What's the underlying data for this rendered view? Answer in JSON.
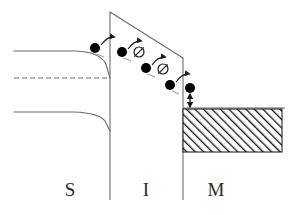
{
  "figure": {
    "kind": "semiconductor-band-diagram",
    "background_color": "#ffffff",
    "line_color": "#6b6b6b",
    "dark_line_color": "#333333",
    "carrier_color": "#000000",
    "label_color": "#2b2b2b",
    "hatch_color": "#111111"
  },
  "regions": [
    {
      "id": "semiconductor",
      "label": "S",
      "label_x": 70,
      "label_y": 196,
      "x_start": 14,
      "x_end": 110
    },
    {
      "id": "insulator",
      "label": "I",
      "label_x": 146,
      "label_y": 196,
      "x_start": 110,
      "x_end": 183
    },
    {
      "id": "metal",
      "label": "M",
      "label_x": 216,
      "label_y": 196,
      "x_start": 183,
      "x_end": 285
    }
  ],
  "interfaces": [
    {
      "id": "s-i-interface",
      "x": 110,
      "y_top": 12,
      "y_bottom": 200
    },
    {
      "id": "i-m-interface",
      "x": 183,
      "y_top": 58,
      "y_bottom": 200
    }
  ],
  "bands": {
    "semiconductor_conduction_band": {
      "name": "conduction-band-edge",
      "style": "solid",
      "path": "M 14 51 L 76 51 Q 100 52 106 64 L 110 78"
    },
    "semiconductor_fermi_level": {
      "name": "fermi-level",
      "style": "dashed",
      "dash": "5,3",
      "path": "M 14 78 L 110 78"
    },
    "semiconductor_valence_band": {
      "name": "valence-band-edge",
      "style": "solid",
      "path": "M 14 112 L 74 112 Q 99 113 105 121 L 110 131"
    },
    "insulator_conduction_band": {
      "name": "insulator-conduction-band",
      "style": "solid",
      "path": "M 110 12 L 183 58"
    },
    "metal_fermi_level": {
      "name": "metal-fermi-level",
      "style": "solid",
      "path": "M 183 108 L 285 108"
    }
  },
  "metal_fill": {
    "name": "metal-filled-states",
    "x": 183,
    "y": 109,
    "width": 99,
    "height": 43,
    "hatch": "diagonal-45"
  },
  "carriers": [
    {
      "id": "electron-1",
      "type": "electron",
      "cx": 95,
      "cy": 48,
      "r": 5
    },
    {
      "id": "electron-2",
      "type": "electron",
      "cx": 122,
      "cy": 52,
      "r": 5
    },
    {
      "id": "electron-3",
      "type": "electron",
      "cx": 146,
      "cy": 68,
      "r": 5
    },
    {
      "id": "electron-4",
      "type": "electron",
      "cx": 170,
      "cy": 85,
      "r": 5
    },
    {
      "id": "electron-5",
      "type": "electron",
      "cx": 190,
      "cy": 88,
      "r": 5
    }
  ],
  "empty_states": [
    {
      "id": "empty-trap-1",
      "type": "empty-state",
      "cx": 139,
      "cy": 52,
      "r": 5
    },
    {
      "id": "empty-trap-2",
      "type": "empty-state",
      "cx": 163,
      "cy": 69,
      "r": 5
    }
  ],
  "hop_arrows": [
    {
      "id": "hop-arrow-1",
      "path": "M 101 45 Q 108 36 114 37"
    },
    {
      "id": "hop-arrow-2",
      "path": "M 128 49 Q 135 40 141 41"
    },
    {
      "id": "hop-arrow-3",
      "path": "M 152 65 Q 159 56 165 57"
    },
    {
      "id": "hop-arrow-4",
      "path": "M 176 82 Q 183 73 189 74"
    }
  ],
  "tail_marks": [
    {
      "id": "tail-mark-1",
      "path": "M 97 54 L 104 57"
    },
    {
      "id": "tail-mark-2",
      "path": "M 124 58 L 131 61"
    },
    {
      "id": "tail-mark-3",
      "path": "M 148 74 L 155 77"
    },
    {
      "id": "tail-mark-4",
      "path": "M 172 91 L 179 94"
    }
  ],
  "relaxation_arrow": {
    "id": "relaxation-arrow",
    "x": 190,
    "y_start": 94,
    "y_end": 107,
    "double_headed": true
  }
}
